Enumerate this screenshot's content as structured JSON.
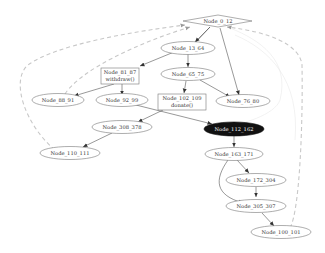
{
  "diagram": {
    "type": "directed-graph",
    "nodes": [
      {
        "id": "n0",
        "label": "Node_0_12",
        "shape": "diamond"
      },
      {
        "id": "n13",
        "label": "Node_13_64",
        "shape": "ellipse"
      },
      {
        "id": "n81",
        "label": "Node_81_87",
        "sublabel": "withdraw()",
        "shape": "box"
      },
      {
        "id": "n65",
        "label": "Node_65_75",
        "shape": "ellipse"
      },
      {
        "id": "n88",
        "label": "Node_88_91",
        "shape": "ellipse"
      },
      {
        "id": "n92",
        "label": "Node_92_99",
        "shape": "ellipse"
      },
      {
        "id": "n102",
        "label": "Node_102_109",
        "sublabel": "donate()",
        "shape": "box"
      },
      {
        "id": "n76",
        "label": "Node_76_80",
        "shape": "ellipse"
      },
      {
        "id": "n308",
        "label": "Node_308_378",
        "shape": "ellipse"
      },
      {
        "id": "n112",
        "label": "Node_112_162",
        "shape": "ellipse",
        "highlighted": true
      },
      {
        "id": "n110",
        "label": "Node_110_111",
        "shape": "ellipse"
      },
      {
        "id": "n163",
        "label": "Node_163_171",
        "shape": "ellipse"
      },
      {
        "id": "n172",
        "label": "Node_172_304",
        "shape": "ellipse"
      },
      {
        "id": "n305",
        "label": "Node_305_307",
        "shape": "ellipse"
      },
      {
        "id": "n100",
        "label": "Node_100_101",
        "shape": "ellipse"
      }
    ],
    "edges": [
      {
        "from": "Node_0_12",
        "to": "Node_13_64",
        "style": "solid"
      },
      {
        "from": "Node_0_12",
        "to": "Node_76_80",
        "style": "solid"
      },
      {
        "from": "Node_13_64",
        "to": "Node_81_87",
        "style": "solid"
      },
      {
        "from": "Node_13_64",
        "to": "Node_65_75",
        "style": "solid"
      },
      {
        "from": "Node_81_87",
        "to": "Node_88_91",
        "style": "solid"
      },
      {
        "from": "Node_81_87",
        "to": "Node_92_99",
        "style": "solid"
      },
      {
        "from": "Node_65_75",
        "to": "Node_102_109",
        "style": "solid"
      },
      {
        "from": "Node_65_75",
        "to": "Node_76_80",
        "style": "solid"
      },
      {
        "from": "Node_102_109",
        "to": "Node_308_378",
        "style": "solid"
      },
      {
        "from": "Node_92_99",
        "to": "Node_112_162",
        "style": "solid"
      },
      {
        "from": "Node_308_378",
        "to": "Node_110_111",
        "style": "solid"
      },
      {
        "from": "Node_112_162",
        "to": "Node_163_171",
        "style": "solid"
      },
      {
        "from": "Node_163_171",
        "to": "Node_172_304",
        "style": "solid"
      },
      {
        "from": "Node_163_171",
        "to": "Node_305_307",
        "style": "solid"
      },
      {
        "from": "Node_172_304",
        "to": "Node_305_307",
        "style": "solid"
      },
      {
        "from": "Node_305_307",
        "to": "Node_100_101",
        "style": "solid"
      },
      {
        "from": "Node_110_111",
        "to": "Node_0_12",
        "style": "dashed"
      },
      {
        "from": "Node_88_91",
        "to": "Node_0_12",
        "style": "dashed"
      },
      {
        "from": "Node_100_101",
        "to": "Node_0_12",
        "style": "dashed"
      }
    ]
  },
  "labels": {
    "n0": "Node_0_12",
    "n13": "Node_13_64",
    "n81": "Node_81_87",
    "n81_sub": "withdraw()",
    "n65": "Node_65_75",
    "n88": "Node_88_91",
    "n92": "Node_92_99",
    "n102": "Node_102_109",
    "n102_sub": "donate()",
    "n76": "Node_76_80",
    "n308": "Node_308_378",
    "n112": "Node_112_162",
    "n110": "Node_110_111",
    "n163": "Node_163_171",
    "n172": "Node_172_304",
    "n305": "Node_305_307",
    "n100": "Node_100_101"
  },
  "colors": {
    "background": "#ffffff",
    "highlight_node": "#111111",
    "dashed_edge": "#c8c8c8",
    "solid_edge": "#444444"
  }
}
